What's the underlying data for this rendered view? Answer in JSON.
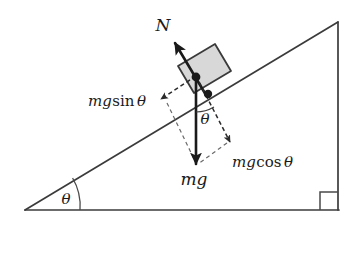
{
  "diagram": {
    "background_color": "#ffffff",
    "line_color": "#3b3b3b",
    "vector_color": "#1a1a1a",
    "dashed_color": "#5a5a5a",
    "block_fill": "#d8d8d8",
    "block_stroke": "#3a3a3a",
    "labels": {
      "normal_force": "N",
      "weight": "mg",
      "weight_parallel": "mg sin θ",
      "weight_perpendicular": "mg cos θ",
      "incline_angle": "θ",
      "vector_angle": "θ"
    },
    "label_parts": {
      "weight_mg": "mg",
      "sin_prefix": "mg",
      "sin_fn": "sin",
      "sin_theta": "θ",
      "cos_prefix": "mg",
      "cos_fn": "cos",
      "cos_theta": "θ"
    },
    "geometry": {
      "triangle_vertices": [
        [
          25,
          210
        ],
        [
          338,
          210
        ],
        [
          338,
          22
        ]
      ],
      "incline_angle_degrees": 31,
      "right_angle_marker": true,
      "block_center": [
        196,
        77
      ],
      "normal_vector_tip": [
        174,
        42
      ],
      "weight_vector_tip": [
        196,
        163
      ],
      "parallel_vector_tip": [
        162,
        100
      ],
      "perpendicular_vector_tip": [
        229,
        141
      ]
    }
  }
}
